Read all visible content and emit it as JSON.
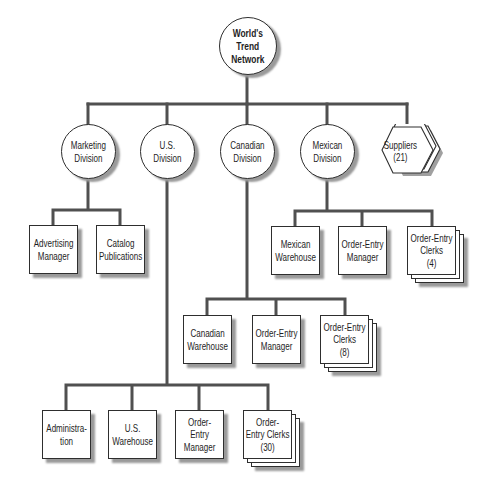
{
  "org_chart": {
    "root": {
      "lines": [
        "World's",
        "Trend",
        "Network"
      ]
    },
    "marketing": {
      "lines": [
        "Marketing",
        "Division"
      ],
      "children": [
        {
          "lines": [
            "Advertising",
            "Manager"
          ]
        },
        {
          "lines": [
            "Catalog",
            "Publications"
          ]
        }
      ]
    },
    "us": {
      "lines": [
        "U.S.",
        "Division"
      ],
      "children": [
        {
          "lines": [
            "Administra-",
            "tion"
          ]
        },
        {
          "lines": [
            "U.S.",
            "Warehouse"
          ]
        },
        {
          "lines": [
            "Order-",
            "Entry",
            "Manager"
          ]
        },
        {
          "lines": [
            "Order-",
            "Entry Clerks",
            "(30)"
          ],
          "stacked": true
        }
      ]
    },
    "canadian": {
      "lines": [
        "Canadian",
        "Division"
      ],
      "children": [
        {
          "lines": [
            "Canadian",
            "Warehouse"
          ]
        },
        {
          "lines": [
            "Order-Entry",
            "Manager"
          ]
        },
        {
          "lines": [
            "Order-Entry",
            "Clerks",
            "(8)"
          ],
          "stacked": true
        }
      ]
    },
    "mexican": {
      "lines": [
        "Mexican",
        "Division"
      ],
      "children": [
        {
          "lines": [
            "Mexican",
            "Warehouse"
          ]
        },
        {
          "lines": [
            "Order-Entry",
            "Manager"
          ]
        },
        {
          "lines": [
            "Order-Entry",
            "Clerks",
            "(4)"
          ],
          "stacked": true
        }
      ]
    },
    "suppliers": {
      "lines": [
        "Suppliers",
        "(21)"
      ],
      "stacked": true
    }
  },
  "colors": {
    "connector": "#505050",
    "border": "#2e2e2e",
    "shadow": "#9a9a9a",
    "fill": "#ffffff"
  }
}
